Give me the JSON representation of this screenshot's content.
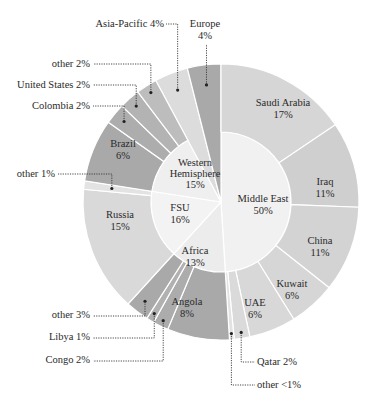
{
  "chart_data": {
    "type": "sunburst",
    "title": "",
    "start_angle_deg": 0,
    "direction": "clockwise",
    "inner": [
      {
        "name": "Middle East",
        "label": "Middle East\n50%",
        "value": 50,
        "color": "#f1f1f1"
      },
      {
        "name": "Africa",
        "label": "Africa\n13%",
        "value": 13,
        "color": "#ececec"
      },
      {
        "name": "FSU",
        "label": "FSU\n16%",
        "value": 16,
        "color": "#f3f3f3"
      },
      {
        "name": "Western Hemisphere",
        "label": "Western\nHemisphere\n15%",
        "value": 15,
        "color": "#efefef"
      },
      {
        "name": "Asia-Pacific",
        "label": "Asia-Pacific 4%",
        "value": 4,
        "color": "#dcdcdc",
        "full_wedge": true
      },
      {
        "name": "Europe",
        "label": "Europe\n4%",
        "value": 4,
        "color": "#a9a9a9",
        "full_wedge": true
      }
    ],
    "outer": [
      {
        "parent": "Middle East",
        "name": "Saudi Arabia",
        "value": 17,
        "label": "Saudi Arabia\n17%",
        "color": "#d6d6d6"
      },
      {
        "parent": "Middle East",
        "name": "Iraq",
        "value": 11,
        "label": "Iraq\n11%",
        "color": "#cfcfcf"
      },
      {
        "parent": "Middle East",
        "name": "China",
        "value": 11,
        "label": "China\n11%",
        "color": "#d3d3d3"
      },
      {
        "parent": "Middle East",
        "name": "Kuwait",
        "value": 6,
        "label": "Kuwait\n6%",
        "color": "#d6d6d6"
      },
      {
        "parent": "Middle East",
        "name": "UAE",
        "value": 6,
        "label": "UAE\n6%",
        "color": "#d8d8d8"
      },
      {
        "parent": "Middle East",
        "name": "Qatar",
        "value": 2,
        "label": "Qatar 2%",
        "color": "#dadada",
        "callout": true
      },
      {
        "parent": "Middle East",
        "name": "other",
        "value": 0.6,
        "label": "other <1%",
        "color": "#e2e2e2",
        "callout": true
      },
      {
        "parent": "Africa",
        "name": "Angola",
        "value": 8,
        "label": "Angola\n8%",
        "color": "#a9a9a9"
      },
      {
        "parent": "Africa",
        "name": "Congo",
        "value": 2,
        "label": "Congo 2%",
        "color": "#acacac",
        "callout": true
      },
      {
        "parent": "Africa",
        "name": "Libya",
        "value": 1,
        "label": "Libya 1%",
        "color": "#b1b1b1",
        "callout": true
      },
      {
        "parent": "Africa",
        "name": "other",
        "value": 3,
        "label": "other 3%",
        "color": "#a9a9a9",
        "callout": true
      },
      {
        "parent": "FSU",
        "name": "Russia",
        "value": 15,
        "label": "Russia\n15%",
        "color": "#d9d9d9"
      },
      {
        "parent": "FSU",
        "name": "other",
        "value": 1,
        "label": "other 1%",
        "color": "#e3e3e3",
        "callout": true
      },
      {
        "parent": "Western Hemisphere",
        "name": "Brazil",
        "value": 6,
        "label": "Brazil\n6%",
        "color": "#a9a9a9"
      },
      {
        "parent": "Western Hemisphere",
        "name": "Colombia",
        "value": 2,
        "label": "Colombia 2%",
        "color": "#adadad",
        "callout": true
      },
      {
        "parent": "Western Hemisphere",
        "name": "United States",
        "value": 2,
        "label": "United States 2%",
        "color": "#b3b3b3",
        "callout": true
      },
      {
        "parent": "Western Hemisphere",
        "name": "other",
        "value": 2,
        "label": "other 2%",
        "color": "#bdbdbd",
        "callout": true
      }
    ],
    "legend": null,
    "grid": false
  },
  "labels": {
    "europe": "Europe",
    "europe_pct": "4%",
    "asia_pacific": "Asia-Pacific 4%",
    "wh_other": "other 2%",
    "us": "United States 2%",
    "colombia": "Colombia 2%",
    "fsu_other": "other 1%",
    "africa_other": "other 3%",
    "libya": "Libya 1%",
    "congo": "Congo 2%",
    "qatar": "Qatar 2%",
    "me_other": "other <1%",
    "saudi": "Saudi Arabia",
    "saudi_pct": "17%",
    "iraq": "Iraq",
    "iraq_pct": "11%",
    "china": "China",
    "china_pct": "11%",
    "kuwait": "Kuwait",
    "kuwait_pct": "6%",
    "uae": "UAE",
    "uae_pct": "6%",
    "angola": "Angola",
    "angola_pct": "8%",
    "russia": "Russia",
    "russia_pct": "15%",
    "brazil": "Brazil",
    "brazil_pct": "6%",
    "middle_east": "Middle East",
    "middle_east_pct": "50%",
    "africa": "Africa",
    "africa_pct": "13%",
    "fsu": "FSU",
    "fsu_pct": "16%",
    "wh1": "Western",
    "wh2": "Hemisphere",
    "wh_pct": "15%"
  }
}
